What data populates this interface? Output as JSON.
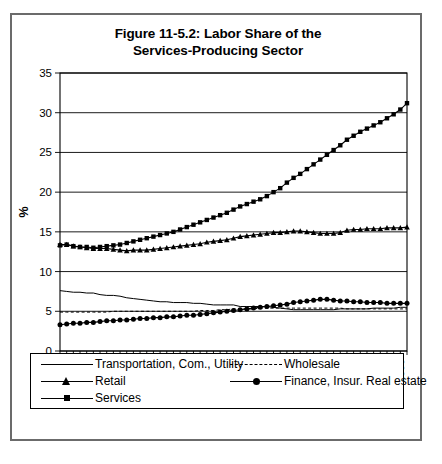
{
  "figure": {
    "title_line1": "Figure 11-5.2:  Labor Share of the",
    "title_line2": "Services-Producing Sector"
  },
  "legend": {
    "items": [
      {
        "label": "Transportation, Com., Utility",
        "marker": "none",
        "style": "solid"
      },
      {
        "label": "Wholesale",
        "marker": "none",
        "style": "dashed"
      },
      {
        "label": "Retail",
        "marker": "triangle",
        "style": "solid"
      },
      {
        "label": "Finance, Insur. Real estate",
        "marker": "circle",
        "style": "solid"
      },
      {
        "label": "Services",
        "marker": "square",
        "style": "solid"
      }
    ]
  },
  "chart_data": {
    "type": "line",
    "title": "Figure 11-5.2:  Labor Share of the Services-Producing Sector",
    "xlabel": "",
    "ylabel": "%",
    "ylim": [
      0,
      35
    ],
    "yticks": [
      0,
      5,
      10,
      15,
      20,
      25,
      30,
      35
    ],
    "xlim": [
      1948,
      2000
    ],
    "xtick_labels": [
      "1948",
      "1951",
      "1954",
      "1957",
      "1960",
      "1963",
      "1966",
      "1969",
      "1972",
      "1975",
      "1978",
      "1981",
      "1984",
      "1987",
      "1990",
      "1993",
      "1996",
      "1999"
    ],
    "xtick_interval": 3,
    "minor_tick_interval": 1,
    "grid": true,
    "legend_position": "below",
    "x": [
      1948,
      1949,
      1950,
      1951,
      1952,
      1953,
      1954,
      1955,
      1956,
      1957,
      1958,
      1959,
      1960,
      1961,
      1962,
      1963,
      1964,
      1965,
      1966,
      1967,
      1968,
      1969,
      1970,
      1971,
      1972,
      1973,
      1974,
      1975,
      1976,
      1977,
      1978,
      1979,
      1980,
      1981,
      1982,
      1983,
      1984,
      1985,
      1986,
      1987,
      1988,
      1989,
      1990,
      1991,
      1992,
      1993,
      1994,
      1995,
      1996,
      1997,
      1998,
      1999,
      2000
    ],
    "series": [
      {
        "name": "Transportation, Com., Utility",
        "marker": "none",
        "style": "solid",
        "values": [
          7.6,
          7.5,
          7.4,
          7.4,
          7.3,
          7.3,
          7.1,
          7.0,
          7.0,
          6.9,
          6.7,
          6.6,
          6.5,
          6.4,
          6.3,
          6.2,
          6.2,
          6.1,
          6.1,
          6.1,
          6.0,
          6.0,
          5.9,
          5.8,
          5.8,
          5.8,
          5.8,
          5.6,
          5.6,
          5.6,
          5.6,
          5.6,
          5.5,
          5.4,
          5.3,
          5.2,
          5.2,
          5.2,
          5.2,
          5.2,
          5.2,
          5.2,
          5.3,
          5.3,
          5.3,
          5.3,
          5.3,
          5.4,
          5.4,
          5.4,
          5.4,
          5.5,
          5.5
        ]
      },
      {
        "name": "Wholesale",
        "marker": "none",
        "style": "dashed",
        "values": [
          4.9,
          4.9,
          4.9,
          4.9,
          4.9,
          4.9,
          4.9,
          4.9,
          5.0,
          5.0,
          5.0,
          5.0,
          5.0,
          5.0,
          5.0,
          5.0,
          5.0,
          5.0,
          5.0,
          5.0,
          5.0,
          5.1,
          5.1,
          5.1,
          5.2,
          5.2,
          5.3,
          5.3,
          5.3,
          5.3,
          5.4,
          5.4,
          5.4,
          5.4,
          5.4,
          5.4,
          5.4,
          5.4,
          5.4,
          5.4,
          5.4,
          5.4,
          5.4,
          5.3,
          5.3,
          5.3,
          5.3,
          5.3,
          5.3,
          5.3,
          5.3,
          5.3,
          5.3
        ]
      },
      {
        "name": "Retail",
        "marker": "triangle",
        "style": "solid",
        "values": [
          13.4,
          13.4,
          13.2,
          13.1,
          13.0,
          12.9,
          12.9,
          12.9,
          12.8,
          12.7,
          12.6,
          12.7,
          12.7,
          12.7,
          12.8,
          12.9,
          13.0,
          13.1,
          13.2,
          13.3,
          13.4,
          13.5,
          13.7,
          13.8,
          13.9,
          14.0,
          14.2,
          14.4,
          14.5,
          14.6,
          14.7,
          14.8,
          14.9,
          14.9,
          15.0,
          15.1,
          15.1,
          15.0,
          14.9,
          14.8,
          14.8,
          14.8,
          14.9,
          15.2,
          15.3,
          15.3,
          15.4,
          15.4,
          15.4,
          15.5,
          15.5,
          15.5,
          15.6
        ]
      },
      {
        "name": "Finance, Insur. Real estate",
        "marker": "circle",
        "style": "solid",
        "values": [
          3.3,
          3.4,
          3.5,
          3.5,
          3.6,
          3.6,
          3.7,
          3.8,
          3.8,
          3.9,
          3.9,
          4.0,
          4.1,
          4.1,
          4.2,
          4.2,
          4.3,
          4.3,
          4.4,
          4.5,
          4.5,
          4.6,
          4.7,
          4.8,
          4.9,
          5.0,
          5.1,
          5.2,
          5.3,
          5.4,
          5.5,
          5.6,
          5.7,
          5.8,
          5.9,
          6.1,
          6.2,
          6.3,
          6.4,
          6.5,
          6.5,
          6.4,
          6.3,
          6.3,
          6.2,
          6.2,
          6.1,
          6.1,
          6.1,
          6.0,
          6.0,
          6.0,
          6.0
        ]
      },
      {
        "name": "Services",
        "marker": "square",
        "style": "solid",
        "values": [
          13.3,
          13.4,
          13.2,
          13.1,
          13.1,
          13.0,
          13.1,
          13.2,
          13.3,
          13.4,
          13.6,
          13.8,
          14.0,
          14.2,
          14.4,
          14.6,
          14.8,
          15.0,
          15.3,
          15.6,
          15.9,
          16.2,
          16.5,
          16.8,
          17.1,
          17.4,
          17.8,
          18.2,
          18.5,
          18.8,
          19.1,
          19.5,
          20.0,
          20.5,
          21.2,
          21.8,
          22.3,
          22.9,
          23.5,
          24.1,
          24.7,
          25.3,
          25.9,
          26.6,
          27.1,
          27.6,
          28.0,
          28.4,
          28.8,
          29.3,
          29.8,
          30.4,
          31.2
        ]
      }
    ]
  }
}
